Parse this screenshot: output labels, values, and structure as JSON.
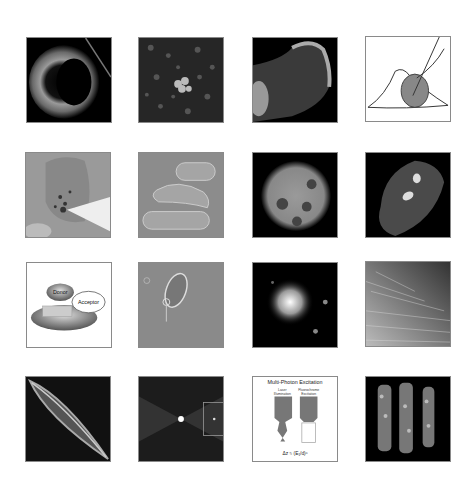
{
  "grid": {
    "rows": 4,
    "columns": 4,
    "background": "#ffffff",
    "tiles": [
      {
        "id": 1,
        "kind": "fluorescence-cell-ring",
        "theme": "dark"
      },
      {
        "id": 2,
        "kind": "fluorescence-speckle-cluster",
        "theme": "dark"
      },
      {
        "id": 3,
        "kind": "fluorescence-cell-filopodia",
        "theme": "dark"
      },
      {
        "id": 4,
        "kind": "cell-drawing-with-pipette",
        "theme": "light"
      },
      {
        "id": 5,
        "kind": "microinjection-cell",
        "theme": "gray"
      },
      {
        "id": 6,
        "kind": "dic-rod-cells",
        "theme": "gray"
      },
      {
        "id": 7,
        "kind": "fluorescent-nucleus",
        "theme": "dark"
      },
      {
        "id": 8,
        "kind": "fluorescent-cell-speckled",
        "theme": "dark"
      },
      {
        "id": 9,
        "kind": "fret-diagram",
        "theme": "light"
      },
      {
        "id": 10,
        "kind": "phase-contrast-organism",
        "theme": "gray"
      },
      {
        "id": 11,
        "kind": "fluorescent-bright-spot",
        "theme": "dark"
      },
      {
        "id": 12,
        "kind": "fibers-texture",
        "theme": "gray"
      },
      {
        "id": 13,
        "kind": "diatom-elongated",
        "theme": "dark"
      },
      {
        "id": 14,
        "kind": "point-spread-function",
        "theme": "dark"
      },
      {
        "id": 15,
        "kind": "multiphoton-diagram",
        "theme": "light"
      },
      {
        "id": 16,
        "kind": "3d-reconstruction-columns",
        "theme": "dark"
      }
    ]
  },
  "fret_diagram": {
    "donor_label": "Donor",
    "acceptor_label": "Acceptor"
  },
  "multiphoton_diagram": {
    "title": "Multi-Photon Excitation",
    "left_label_line1": "Laser",
    "left_label_line2": "Illumination",
    "right_label_line1": "Fluorochrome",
    "right_label_line2": "Excitation",
    "formula": "Δz ≈ (E₁/d)ⁿ"
  }
}
